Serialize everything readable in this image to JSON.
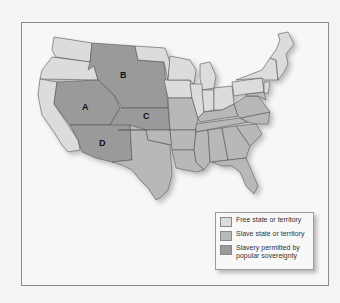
{
  "map": {
    "type": "historical-us-map",
    "colors": {
      "free": "#dcdcdc",
      "slave": "#b8b8b8",
      "popular_sovereignty": "#9a9a9a",
      "border": "#555555",
      "background": "#f7f7f7"
    },
    "region_labels": [
      {
        "id": "A",
        "text": "A"
      },
      {
        "id": "B",
        "text": "B"
      },
      {
        "id": "C",
        "text": "C"
      },
      {
        "id": "D",
        "text": "D"
      }
    ]
  },
  "legend": {
    "items": [
      {
        "label": "Free state or territory",
        "color": "#dcdcdc"
      },
      {
        "label": "Slave state or territory",
        "color": "#b8b8b8"
      },
      {
        "label": "Slavery permitted by popular sovereignty",
        "color": "#9a9a9a"
      }
    ]
  }
}
